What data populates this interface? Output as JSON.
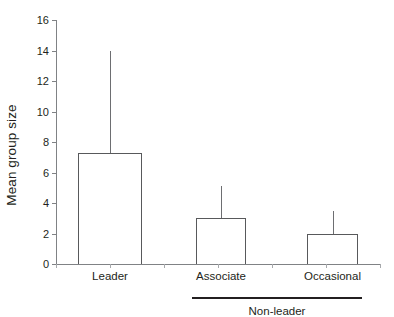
{
  "chart_data": {
    "type": "bar",
    "title": "",
    "xlabel": "",
    "ylabel": "Mean group size",
    "categories": [
      "Leader",
      "Associate",
      "Occasional"
    ],
    "values": [
      7.3,
      3.0,
      2.0
    ],
    "error_upper": [
      14.0,
      5.1,
      3.5
    ],
    "error_type": "upper-only",
    "ylim": [
      0,
      16
    ],
    "ytick_values": [
      0,
      2,
      4,
      6,
      8,
      10,
      12,
      14,
      16
    ],
    "ytick_labels": [
      "0",
      "2",
      "4",
      "6",
      "8",
      "10",
      "12",
      "14",
      "16"
    ],
    "grid": false,
    "legend": false,
    "bar_fill": "#ffffff",
    "bar_edge": "#58595b",
    "axis_color": "#808285",
    "error_color": "#6d6e71",
    "annotations": [
      {
        "name": "group-bracket",
        "label": "Non-leader",
        "spans": [
          "Associate",
          "Occasional"
        ]
      }
    ]
  }
}
